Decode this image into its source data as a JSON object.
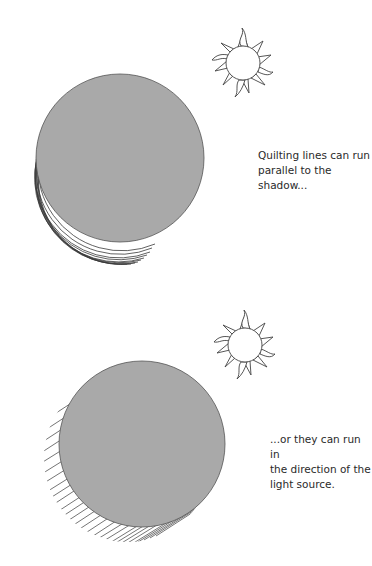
{
  "figures": [
    {
      "id": "parallel",
      "caption_lines": [
        "Quilting lines can run",
        "parallel to the shadow..."
      ],
      "sun_icon": "sun-icon",
      "shape": "gray-circle",
      "shadow_style": "concentric-arcs"
    },
    {
      "id": "light-direction",
      "caption_lines": [
        "...or they can run in",
        "the direction of the",
        "light source."
      ],
      "sun_icon": "sun-icon",
      "shape": "gray-circle",
      "shadow_style": "diagonal-hatching"
    }
  ],
  "colors": {
    "circle_fill": "#a9a9a9",
    "line": "#3a3a3a",
    "background": "#ffffff"
  }
}
